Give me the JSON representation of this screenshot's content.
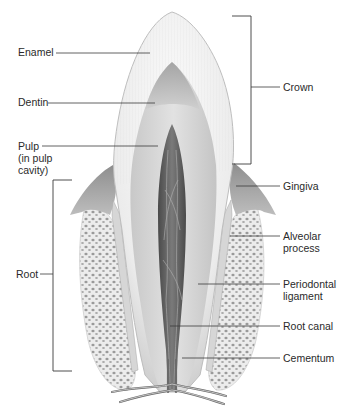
{
  "diagram": {
    "labels_left": [
      {
        "id": "enamel",
        "text": "Enamel"
      },
      {
        "id": "dentin",
        "text": "Dentin"
      },
      {
        "id": "pulp",
        "lines": [
          "Pulp",
          "(in pulp",
          "cavity)"
        ]
      },
      {
        "id": "root",
        "text": "Root"
      }
    ],
    "labels_right": [
      {
        "id": "crown",
        "text": "Crown"
      },
      {
        "id": "gingiva",
        "text": "Gingiva"
      },
      {
        "id": "alveolar-process",
        "lines": [
          "Alveolar",
          "process"
        ]
      },
      {
        "id": "periodontal-ligament",
        "lines": [
          "Periodontal",
          "ligament"
        ]
      },
      {
        "id": "root-canal",
        "text": "Root canal"
      },
      {
        "id": "cementum",
        "text": "Cementum"
      }
    ],
    "brackets": [
      {
        "id": "crown-bracket",
        "label": "Crown",
        "side": "right"
      },
      {
        "id": "root-bracket",
        "label": "Root",
        "side": "left"
      }
    ],
    "colors": {
      "enamel": "#f4f4f4",
      "dentin": "#cfcfcf",
      "dentin_dark": "#9c9c9c",
      "pulp": "#5e5e5e",
      "gingiva": "#a9a9a9",
      "bone": "#e6e6e6",
      "bone_pores": "#8f8f8f",
      "leader_line": "#3a3a3a",
      "text": "#2a2a2a"
    }
  }
}
